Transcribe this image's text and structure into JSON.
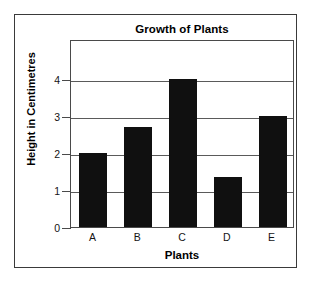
{
  "chart_data": {
    "type": "bar",
    "title": "Growth of Plants",
    "xlabel": "Plants",
    "ylabel": "Height in Centimetres",
    "categories": [
      "A",
      "B",
      "C",
      "D",
      "E"
    ],
    "values": [
      2.0,
      2.7,
      4.0,
      1.35,
      3.0
    ],
    "ytick_labels": [
      "0",
      "1",
      "2",
      "3",
      "4"
    ],
    "ytick_values": [
      0,
      1,
      2,
      3,
      4
    ],
    "ylim": [
      0,
      5.07
    ],
    "xlim": [
      0,
      5
    ],
    "grid": "horizontal",
    "legend": "none",
    "bar_color": "#101010",
    "axis_color": "#4a4a4a",
    "grid_color": "#5a5a5a",
    "background_color": "#ffffff",
    "frame_color": "#3a3a3a"
  }
}
